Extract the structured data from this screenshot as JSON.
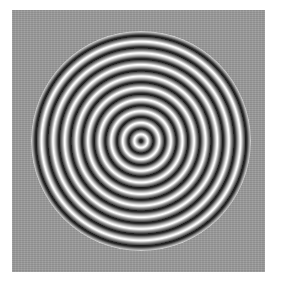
{
  "image": {
    "description": "Concentric circular ring interference pattern on a noisy gray square",
    "background_color": "#9b9b9b",
    "ring_dark_color": "#1a1a1a",
    "ring_light_color": "#ffffff",
    "ring_count_visible": 10
  }
}
